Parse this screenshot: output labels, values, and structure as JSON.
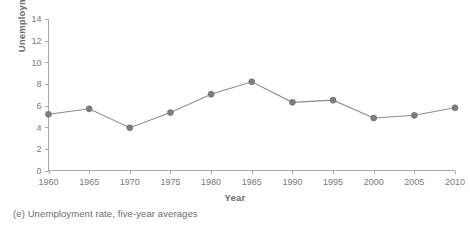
{
  "caption": "(e) Unemployment rate, five-year averages",
  "chart_data": {
    "type": "line",
    "title": "",
    "xlabel": "Year",
    "ylabel": "Unemployment Rate (%)",
    "x": [
      1960,
      1965,
      1970,
      1975,
      1980,
      1985,
      1990,
      1995,
      2000,
      2005,
      2010
    ],
    "values": [
      5.2,
      5.7,
      3.95,
      5.35,
      7.05,
      8.2,
      6.3,
      6.5,
      4.85,
      5.1,
      5.8
    ],
    "xtick_labels": [
      "1960",
      "1965",
      "1970",
      "1975",
      "1980",
      "1985",
      "1990",
      "1995",
      "2000",
      "2005",
      "2010"
    ],
    "ytick_labels": [
      "0",
      "2",
      "4",
      "6",
      "8",
      "10",
      "12",
      "14"
    ],
    "yticks": [
      0,
      2,
      4,
      6,
      8,
      10,
      12,
      14
    ],
    "xlim": [
      1960,
      2010
    ],
    "ylim": [
      0,
      14
    ],
    "grid": false,
    "legend": "none",
    "marker": "circle",
    "line_color": "#8e8e8e",
    "marker_color": "#7d7d7d",
    "axis_color": "#a9a9a9",
    "text_color": "#6d6d6d",
    "background": "#ffffff"
  }
}
